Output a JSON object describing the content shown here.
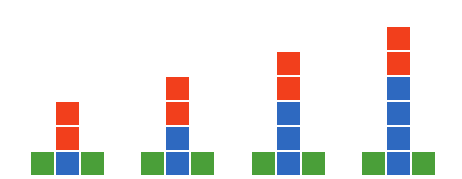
{
  "colors": {
    "red": "#f23f1c",
    "blue": "#2e69c0",
    "green": "#4a9f39",
    "background": "#ffffff"
  },
  "layout": {
    "square_size": 23,
    "pitch": 25,
    "base_bottom_y": 175
  },
  "figures": [
    {
      "index": 1,
      "left_x": 31,
      "green_base": 2,
      "blue_column": 1,
      "red_top": 2
    },
    {
      "index": 2,
      "left_x": 141,
      "green_base": 2,
      "blue_column": 2,
      "red_top": 2
    },
    {
      "index": 3,
      "left_x": 252,
      "green_base": 2,
      "blue_column": 3,
      "red_top": 2
    },
    {
      "index": 4,
      "left_x": 362,
      "green_base": 2,
      "blue_column": 4,
      "red_top": 2
    }
  ]
}
